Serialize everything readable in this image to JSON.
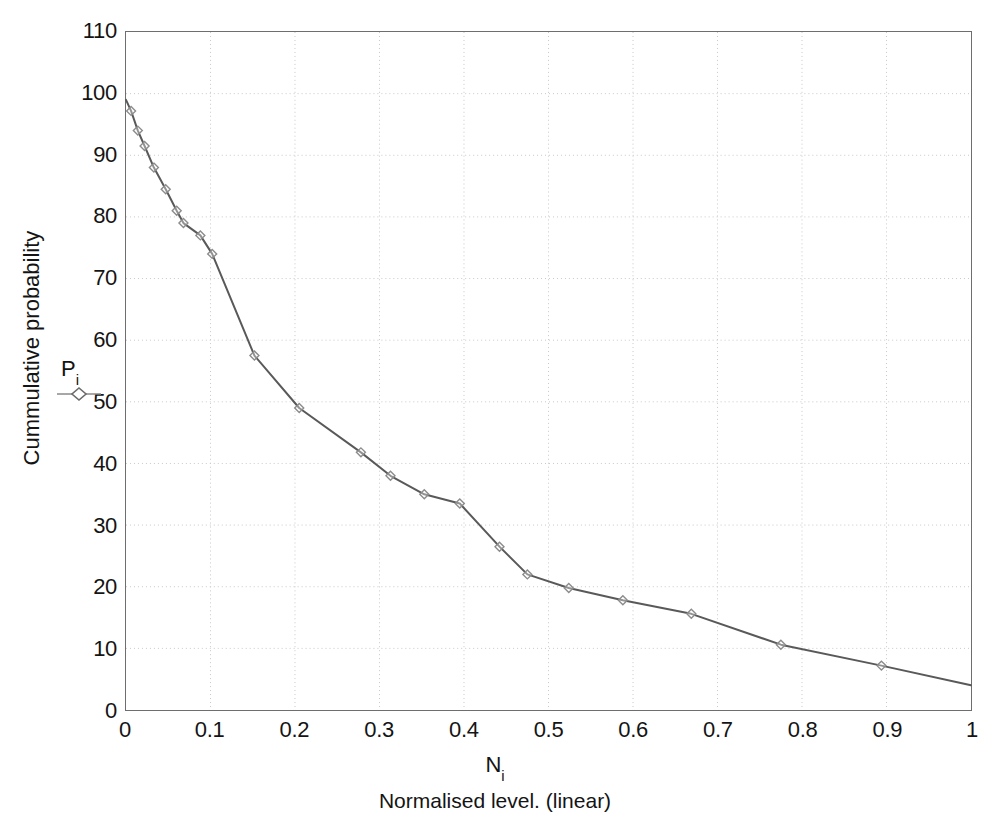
{
  "chart_data": {
    "type": "line",
    "title": "",
    "subtitle": "",
    "xlabel": "N",
    "xlabel_sub": "i",
    "xlabel_description": "Normalised level. (linear)",
    "ylabel": "Cummulative probability",
    "xlim": [
      0,
      1
    ],
    "ylim": [
      0,
      110
    ],
    "xticks": [
      "0",
      "0.1",
      "0.2",
      "0.3",
      "0.4",
      "0.5",
      "0.6",
      "0.7",
      "0.8",
      "0.9",
      "1"
    ],
    "xtick_values": [
      0,
      0.1,
      0.2,
      0.3,
      0.4,
      0.5,
      0.6,
      0.7,
      0.8,
      0.9,
      1
    ],
    "yticks": [
      "0",
      "10",
      "20",
      "30",
      "40",
      "50",
      "60",
      "70",
      "80",
      "90",
      "100",
      "110"
    ],
    "ytick_values": [
      0,
      10,
      20,
      30,
      40,
      50,
      60,
      70,
      80,
      90,
      100,
      110
    ],
    "grid": true,
    "grid_style": "dotted",
    "legend_position": "inline-left-axis",
    "series": [
      {
        "name": "P",
        "name_sub": "i",
        "marker": "diamond",
        "line_color": "#595959",
        "marker_color": "#8c8c8c",
        "x": [
          0.0,
          0.006,
          0.014,
          0.022,
          0.033,
          0.047,
          0.06,
          0.068,
          0.088,
          0.102,
          0.152,
          0.205,
          0.278,
          0.313,
          0.353,
          0.395,
          0.442,
          0.475,
          0.524,
          0.588,
          0.669,
          0.775,
          0.894,
          1.0
        ],
        "y": [
          99.0,
          97.2,
          94.0,
          91.5,
          88.0,
          84.5,
          81.0,
          79.0,
          77.0,
          74.0,
          57.5,
          49.0,
          41.8,
          38.0,
          35.0,
          33.5,
          26.5,
          22.0,
          19.8,
          17.8,
          15.6,
          10.6,
          7.2,
          4.0
        ],
        "annotation": "P_i"
      }
    ]
  },
  "annotations": {
    "pi_label": "P",
    "pi_sub": "i"
  }
}
